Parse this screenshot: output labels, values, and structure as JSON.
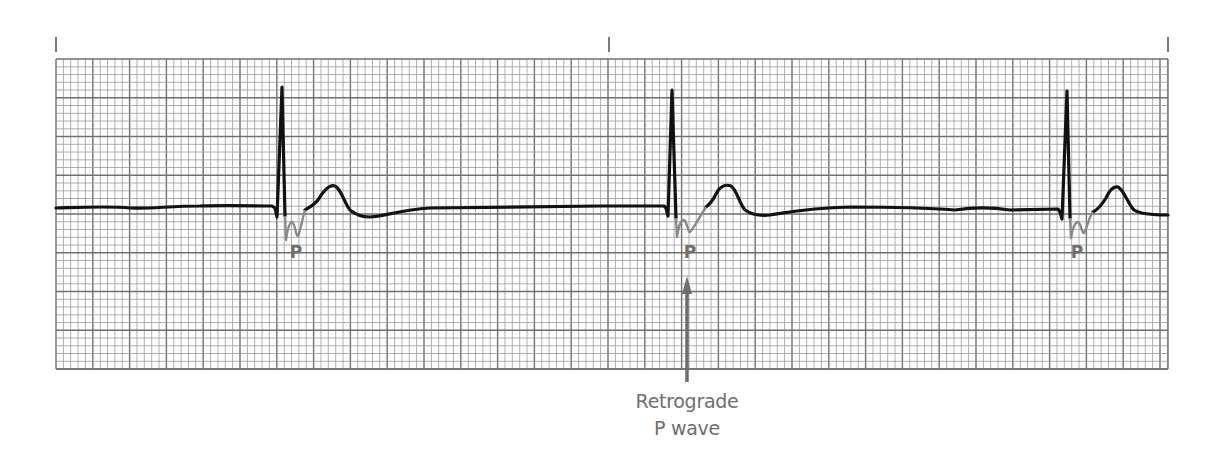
{
  "figure": {
    "grid": {
      "left": 56,
      "top": 59,
      "right": 1168,
      "bottom": 369,
      "large_box_w": 36.8,
      "large_box_h": 38.75,
      "small_per_large": 5,
      "minor_color": "#9a9a9a",
      "major_color": "#6f6f6f"
    },
    "top_markers_x": [
      56,
      609,
      1168
    ],
    "trace_color": "#111111",
    "p_wave_color": "#8a8a8a",
    "p_labels": [
      {
        "text": "P",
        "x": 296,
        "y": 242
      },
      {
        "text": "P",
        "x": 690,
        "y": 242
      },
      {
        "text": "P",
        "x": 1077,
        "y": 242
      }
    ],
    "annotation": {
      "line1": "Retrograde",
      "line2": "P wave",
      "arrow_x": 687,
      "arrow_top": 276,
      "arrow_bottom": 382
    },
    "label_color": "#6e6e6e"
  }
}
